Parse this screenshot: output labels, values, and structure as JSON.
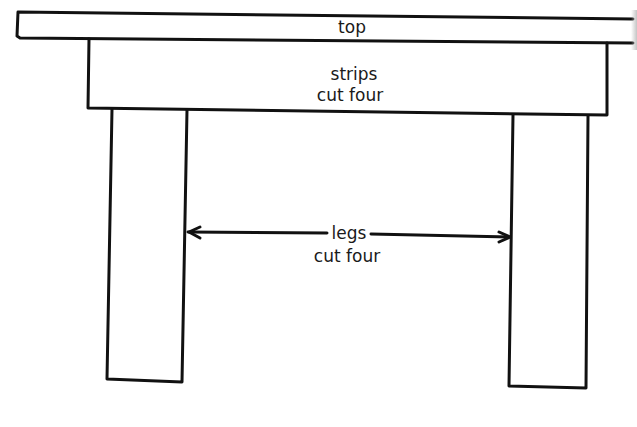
{
  "diagram": {
    "parts": {
      "top": {
        "label": "top"
      },
      "strips": {
        "label_line1": "strips",
        "label_line2": "cut four"
      },
      "legs": {
        "label_line1": "legs",
        "label_line2": "cut four"
      }
    },
    "colors": {
      "line": "#111111",
      "background": "#ffffff",
      "text": "#1a1a1a"
    }
  }
}
